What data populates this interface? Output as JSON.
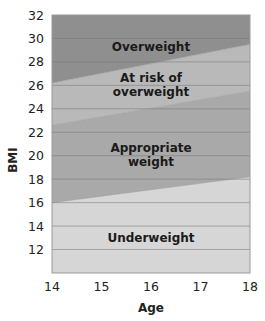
{
  "chart_data": {
    "type": "area",
    "title": "",
    "xlabel": "Age",
    "ylabel": "BMI",
    "xlim": [
      14,
      18
    ],
    "ylim": [
      10,
      32
    ],
    "x_ticks": [
      "14",
      "15",
      "16",
      "17",
      "18"
    ],
    "y_ticks": [
      "12",
      "14",
      "16",
      "18",
      "20",
      "22",
      "24",
      "26",
      "28",
      "30",
      "32"
    ],
    "grid": "horizontal",
    "legend": "none (regions labeled inline)",
    "x": [
      14,
      18
    ],
    "boundaries": [
      {
        "name": "Underweight / Appropriate weight",
        "values": [
          16.0,
          18.2
        ]
      },
      {
        "name": "Appropriate weight / At risk of overweight",
        "values": [
          22.6,
          25.5
        ]
      },
      {
        "name": "At risk of overweight / Overweight",
        "values": [
          26.2,
          29.5
        ]
      }
    ],
    "series": [
      {
        "name": "Underweight",
        "lower": [
          10,
          10
        ],
        "upper": [
          16.0,
          18.2
        ],
        "color": "#d6d6d6"
      },
      {
        "name": "Appropriate weight",
        "lower": [
          16.0,
          18.2
        ],
        "upper": [
          22.6,
          25.5
        ],
        "color": "#a9a9a9"
      },
      {
        "name": "At risk of overweight",
        "lower": [
          22.6,
          25.5
        ],
        "upper": [
          26.2,
          29.5
        ],
        "color": "#b9b9b9"
      },
      {
        "name": "Overweight",
        "lower": [
          26.2,
          29.5
        ],
        "upper": [
          32,
          32
        ],
        "color": "#8f8f8f"
      }
    ],
    "annotations": [
      {
        "text": "Overweight",
        "lines": [
          "Overweight"
        ]
      },
      {
        "text": "At risk of overweight",
        "lines": [
          "At risk of",
          "overweight"
        ]
      },
      {
        "text": "Appropriate weight",
        "lines": [
          "Appropriate",
          "weight"
        ]
      },
      {
        "text": "Underweight",
        "lines": [
          "Underweight"
        ]
      }
    ]
  },
  "colors": {
    "gridline": "#7a7a7a",
    "frame": "#9a9a9a"
  }
}
